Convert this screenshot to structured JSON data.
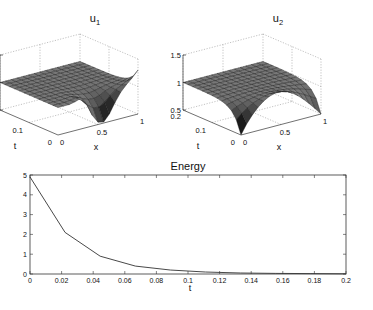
{
  "chart_data": [
    {
      "type": "surface",
      "title": "u1",
      "title_main": "u",
      "title_sub": "1",
      "xlabel": "x",
      "ylabel": "t",
      "zlabel": "",
      "xticks": [
        "0",
        "0.5",
        "1"
      ],
      "yticks": [
        "0",
        "0.1",
        "0.2"
      ],
      "zticks": [
        "0.5",
        "1",
        "1.5"
      ],
      "xlim": [
        0,
        1
      ],
      "ylim": [
        0,
        0.2
      ],
      "zlim": [
        0.5,
        1.5
      ],
      "description": "Surface near 1 for most t; at t=0 a deep dip to ~0.5 near x=0.5 with rise to ~1.3 at x=1"
    },
    {
      "type": "surface",
      "title": "u2",
      "title_main": "u",
      "title_sub": "2",
      "xlabel": "x",
      "ylabel": "t",
      "zlabel": "",
      "xticks": [
        "0",
        "0.5",
        "1"
      ],
      "yticks": [
        "0",
        "0.1",
        "0.2"
      ],
      "zticks": [
        "0.5",
        "1",
        "1.5"
      ],
      "xlim": [
        0,
        1
      ],
      "ylim": [
        0,
        0.2
      ],
      "zlim": [
        0.5,
        1.5
      ],
      "description": "Surface near 1 for most t; at t=0 drops to 0.5 at x=0 and x=1 with peak ~1.1 near x=0.6"
    },
    {
      "type": "line",
      "title": "Energy",
      "xlabel": "t",
      "ylabel": "",
      "xlim": [
        0,
        0.2
      ],
      "ylim": [
        0,
        5
      ],
      "xticks": [
        "0",
        "0.02",
        "0.04",
        "0.06",
        "0.08",
        "0.1",
        "0.12",
        "0.14",
        "0.16",
        "0.18",
        "0.2"
      ],
      "yticks": [
        "0",
        "1",
        "2",
        "3",
        "4",
        "5"
      ],
      "grid": false,
      "x": [
        0,
        0.0222,
        0.0444,
        0.0667,
        0.0889,
        0.1111,
        0.1333,
        0.1556,
        0.1778,
        0.2
      ],
      "series": [
        {
          "name": "Energy",
          "values": [
            4.9,
            2.1,
            0.9,
            0.4,
            0.2,
            0.1,
            0.05,
            0.03,
            0.02,
            0.01
          ]
        }
      ]
    }
  ]
}
